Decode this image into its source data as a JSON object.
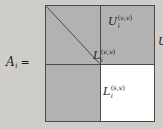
{
  "figure": {
    "kind": "block-matrix-equation",
    "background_color": "#cfcdc9",
    "block_fill_gray": "#b2b2b2",
    "block_fill_white": "#ffffff",
    "border_color": "#4a4a4a",
    "text_color": "#1d1d1d"
  },
  "equation": {
    "lhs_symbol": "A",
    "lhs_subscript": "i",
    "equals": "="
  },
  "blocks": {
    "top_left_upper": {
      "name": "U-upper-vv",
      "base": "U",
      "subscript": "i",
      "superscript_open": "(",
      "superscript_first": "v",
      "superscript_comma": ",",
      "superscript_second": "v",
      "superscript_close": ")",
      "fill": "#b2b2b2"
    },
    "top_left_lower": {
      "name": "L-lower-vv",
      "base": "L",
      "subscript": "i",
      "superscript_open": "(",
      "superscript_first": "v",
      "superscript_comma": ",",
      "superscript_second": "v",
      "superscript_close": ")",
      "fill": "#b2b2b2"
    },
    "top_right": {
      "name": "U-vs",
      "base": "U",
      "subscript": "i",
      "superscript_open": "(",
      "superscript_first": "v",
      "superscript_comma": ",",
      "superscript_second": "s",
      "superscript_close": ")",
      "fill": "#b2b2b2"
    },
    "bottom_left": {
      "name": "L-sv",
      "base": "L",
      "subscript": "i",
      "superscript_open": "(",
      "superscript_first": "s",
      "superscript_comma": ",",
      "superscript_second": "v",
      "superscript_close": ")",
      "fill": "#b2b2b2"
    },
    "bottom_right": {
      "name": "S",
      "base": "S",
      "subscript": "i",
      "fill": "#ffffff"
    }
  }
}
